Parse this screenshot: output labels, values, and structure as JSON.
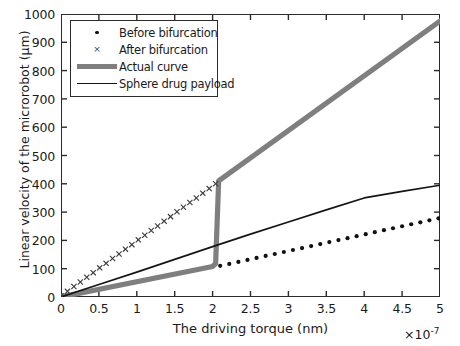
{
  "chart_data": {
    "type": "line",
    "title": "",
    "xlabel": "The driving torque (nm)",
    "ylabel": "Linear velocity of the microrobot (μm)",
    "x_exponent": "×10",
    "x_exponent_power": "-7",
    "xlim": [
      0,
      5
    ],
    "ylim": [
      0,
      1000
    ],
    "xticks": [
      "0",
      "0.5",
      "1",
      "1.5",
      "2",
      "2.5",
      "3",
      "3.5",
      "4",
      "4.5",
      "5"
    ],
    "xtick_values": [
      0,
      0.5,
      1,
      1.5,
      2,
      2.5,
      3,
      3.5,
      4,
      4.5,
      5
    ],
    "yticks": [
      "0",
      "100",
      "200",
      "300",
      "400",
      "500",
      "600",
      "700",
      "800",
      "900",
      "1000"
    ],
    "ytick_values": [
      0,
      100,
      200,
      300,
      400,
      500,
      600,
      700,
      800,
      900,
      1000
    ],
    "grid": false,
    "legend_position": "upper left",
    "colors": {
      "before_bifurcation": "#111111",
      "after_bifurcation": "#3d3d3d",
      "actual_curve": "#7f7f7f",
      "sphere_drug_payload": "#151515",
      "axis": "#2b2b2b",
      "background": "#ffffff"
    },
    "series": [
      {
        "name": "Before bifurcation",
        "marker": "dot",
        "style": "markers",
        "x": [
          2.1,
          2.22,
          2.34,
          2.46,
          2.58,
          2.7,
          2.82,
          2.94,
          3.06,
          3.18,
          3.3,
          3.42,
          3.54,
          3.66,
          3.78,
          3.9,
          4.02,
          4.14,
          4.26,
          4.38,
          4.5,
          4.62,
          4.74,
          4.86,
          4.98
        ],
        "y": [
          110,
          117,
          124,
          131,
          138,
          145,
          152,
          159,
          166,
          173,
          180,
          187,
          194,
          201,
          208,
          215,
          222,
          229,
          236,
          243,
          250,
          257,
          264,
          271,
          278
        ]
      },
      {
        "name": "After bifurcation",
        "marker": "x",
        "style": "markers",
        "x": [
          0.0,
          0.085,
          0.17,
          0.255,
          0.34,
          0.425,
          0.51,
          0.595,
          0.68,
          0.765,
          0.85,
          0.935,
          1.02,
          1.105,
          1.19,
          1.275,
          1.36,
          1.445,
          1.53,
          1.615,
          1.7,
          1.785,
          1.87,
          1.955,
          2.04
        ],
        "y": [
          4,
          20,
          37,
          53,
          70,
          86,
          103,
          119,
          136,
          152,
          169,
          185,
          202,
          218,
          235,
          251,
          268,
          284,
          301,
          317,
          334,
          350,
          367,
          383,
          400
        ]
      },
      {
        "name": "Actual curve",
        "marker": "none",
        "style": "thick-line",
        "x": [
          0.0,
          2.0,
          2.04,
          2.08,
          5.0
        ],
        "y": [
          0,
          108,
          118,
          410,
          975
        ]
      },
      {
        "name": "Sphere drug payload",
        "marker": "none",
        "style": "thin-line",
        "x": [
          0.0,
          0.5,
          1.0,
          1.5,
          2.0,
          2.5,
          3.0,
          3.5,
          4.0,
          4.5,
          5.0
        ],
        "y": [
          0,
          44,
          88,
          133,
          178,
          222,
          265,
          308,
          350,
          373,
          395
        ]
      }
    ]
  },
  "legend": {
    "items": [
      {
        "label": "Before bifurcation",
        "key": "dot-marker"
      },
      {
        "label": "After bifurcation",
        "key": "x-marker"
      },
      {
        "label": "Actual curve",
        "key": "thick-gray-line"
      },
      {
        "label": "Sphere drug payload",
        "key": "thin-black-line"
      }
    ]
  }
}
